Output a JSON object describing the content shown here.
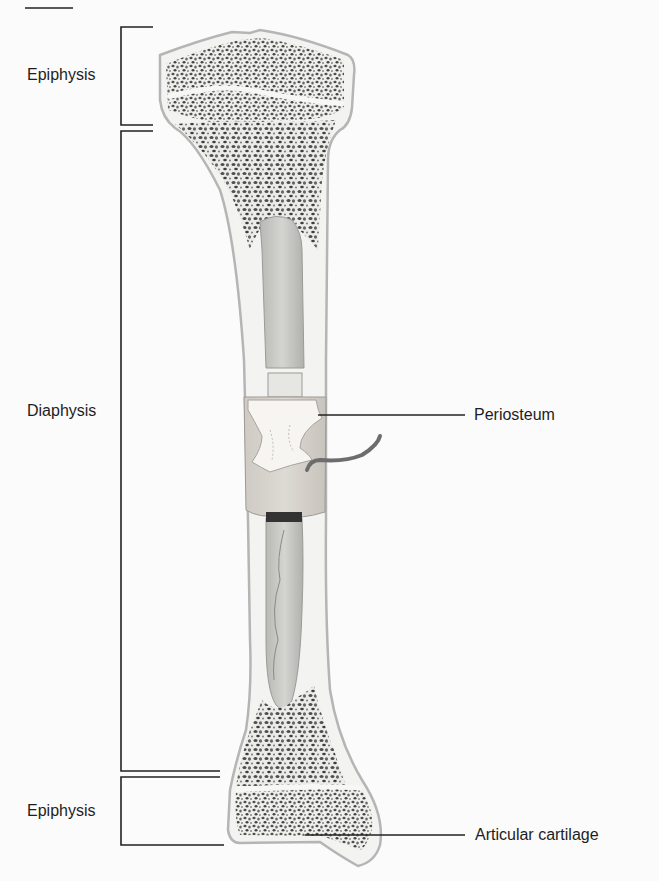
{
  "figure": {
    "labels": {
      "epiphysis_top": "Epiphysis",
      "diaphysis": "Diaphysis",
      "epiphysis_bottom": "Epiphysis",
      "periosteum": "Periosteum",
      "articular_cartilage": "Articular cartilage"
    },
    "colors": {
      "background": "#fbfbfb",
      "bone_outline": "#b5b5b5",
      "compact_bone": "#f3f3f1",
      "spongy_dot": "#5a5a5a",
      "marrow": "#c9c9c6",
      "periosteum": "#d6d2cd",
      "vessel": "#6d6d6d",
      "leader_line": "#222222"
    }
  }
}
